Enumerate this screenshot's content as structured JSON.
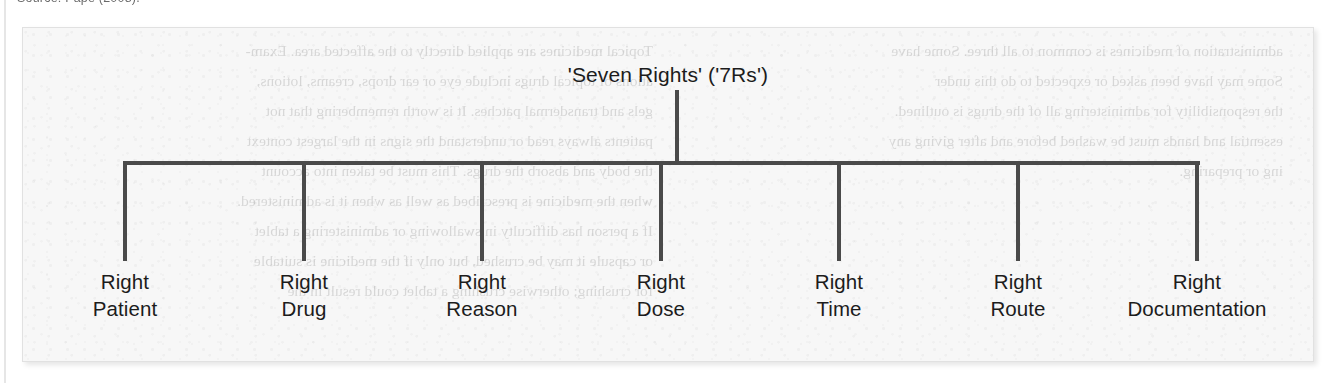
{
  "caption": {
    "source_note": "Source: Pape (2008)."
  },
  "figure": {
    "root": {
      "label": "'Seven Rights' ('7Rs')"
    },
    "branches": [
      {
        "line1": "Right",
        "line2": "Patient",
        "x": 124
      },
      {
        "line1": "Right",
        "line2": "Drug",
        "x": 303
      },
      {
        "line1": "Right",
        "line2": "Reason",
        "x": 481
      },
      {
        "line1": "Right",
        "line2": "Dose",
        "x": 660
      },
      {
        "line1": "Right",
        "line2": "Time",
        "x": 838
      },
      {
        "line1": "Right",
        "line2": "Route",
        "x": 1017
      },
      {
        "line1": "Right",
        "line2": "Documentation",
        "x": 1196
      }
    ],
    "colors": {
      "line": "#4a4a4a",
      "text": "#1c1c1c",
      "panel_background": "#f7f7f7",
      "panel_border": "#e1e1e1",
      "page_background": "#ffffff"
    }
  },
  "showthrough": {
    "left_lines": [
      "administration of medicines is common to all three.  Some have",
      "Some may have been asked or expected to do this under",
      "the responsibility for administering all of the drugs is outlined.",
      "essential and hands must be washed before and after giving any",
      "ing or preparing."
    ],
    "right_lines": [
      "Topical medicines are applied directly to the affected area. Exam-",
      "ations of topical drugs include eye or ear drops, creams, lotions,",
      "gels and transdermal patches. It is worth remembering that not",
      "patients always read or understand the signs in the largest context",
      "the body and absorb the drugs. This must be taken into account",
      "when the medicine is prescribed as well as when it is administered.",
      "If a person has difficulty in swallowing or administering a tablet",
      "or capsule it may be crushed, but only if the medicine is suitable",
      "for crushing; otherwise crushing a tablet could result in the"
    ]
  }
}
